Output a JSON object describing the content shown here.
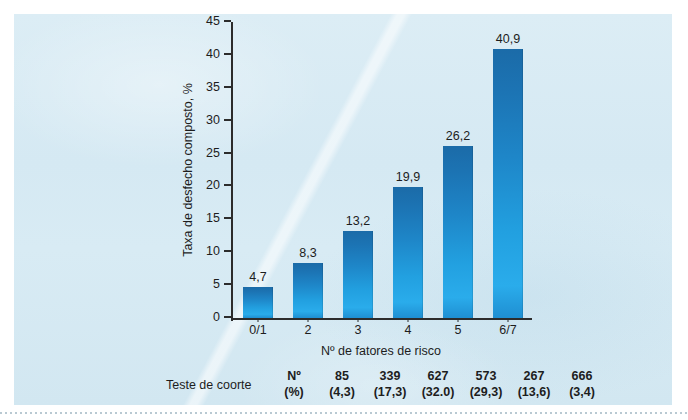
{
  "chart_data": {
    "type": "bar",
    "title": "",
    "subtitle": "",
    "xlabel": "Nº de fatores de risco",
    "ylabel": "Taxa de desfecho composto, %",
    "categories": [
      "0/1",
      "2",
      "3",
      "4",
      "5",
      "6/7"
    ],
    "values": [
      4.7,
      8.3,
      13.2,
      19.9,
      26.2,
      40.9
    ],
    "value_labels": [
      "4,7",
      "8,3",
      "13,2",
      "19,9",
      "26,2",
      "40,9"
    ],
    "ylim": [
      0,
      45
    ],
    "yticks": [
      0,
      5,
      10,
      15,
      20,
      25,
      30,
      35,
      40,
      45
    ],
    "ytick_labels": [
      "0",
      "5",
      "10",
      "15",
      "20",
      "25",
      "30",
      "35",
      "40",
      "45"
    ],
    "grid": false,
    "legend": null,
    "bar_color_top": "#1b6ba8",
    "bar_color_bottom": "#2aaceb",
    "panel_color": "#d5e9f3"
  },
  "cohort_table": {
    "row_label": "Teste de coorte",
    "header": {
      "top": "Nº",
      "bottom": "(%)"
    },
    "columns": [
      {
        "count": "85",
        "percent": "(4,3)"
      },
      {
        "count": "339",
        "percent": "(17,3)"
      },
      {
        "count": "627",
        "percent": "(32.0)"
      },
      {
        "count": "573",
        "percent": "(29,3)"
      },
      {
        "count": "267",
        "percent": "(13,6)"
      },
      {
        "count": "666",
        "percent": "(3,4)"
      }
    ]
  }
}
